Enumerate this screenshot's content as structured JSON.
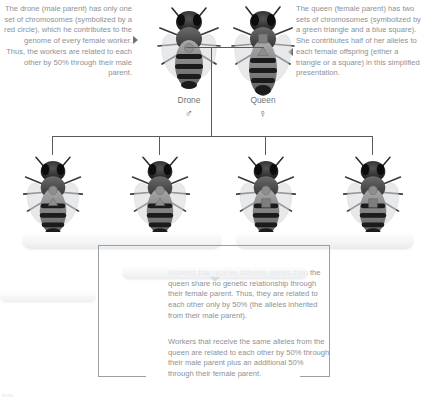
{
  "figure": {
    "caption": "tion"
  },
  "notes": {
    "drone": "The drone (male parent) has only one set of chromosomes (symbolized by a red circle), which he contributes to the genome of every female worker. Thus, the workers are related to each other by 50% through their male parent.",
    "queen": "The queen (female parent) has two sets of chromosomes (symbolized by a green triangle and a blue square). She contributes half of her alleles to each female offspring (either a triangle or a square) in this simplified presentation.",
    "different_alleles": "Workers that receive different alleles from the queen share no genetic relationship through their female parent. Thus, they are related to each other only by 50% (the alleles inherited from their male parent).",
    "same_alleles": "Workers that receive the same alleles from the queen are related to each other by 50% through their male parent plus an additional 50% through their female parent."
  },
  "parents": [
    {
      "id": "drone",
      "label": "Drone",
      "sex_symbol": "♂",
      "sex": "male",
      "alleles": [
        "circle"
      ]
    },
    {
      "id": "queen",
      "label": "Queen",
      "sex_symbol": "♀",
      "sex": "female",
      "alleles": [
        "square",
        "triangle"
      ]
    }
  ],
  "workers": [
    {
      "id": "worker-1",
      "alleles": [
        "circle",
        "triangle"
      ]
    },
    {
      "id": "worker-2",
      "alleles": [
        "circle",
        "triangle"
      ]
    },
    {
      "id": "worker-3",
      "alleles": [
        "circle",
        "square"
      ]
    },
    {
      "id": "worker-4",
      "alleles": [
        "circle",
        "square"
      ]
    }
  ],
  "symbol_colors": {
    "circle": "#8e8e8e",
    "triangle": "#8e8e8e",
    "square": "#7e7e7e",
    "circle_meaning": "red circle",
    "triangle_meaning": "green triangle",
    "square_meaning": "blue square"
  },
  "relatedness": {
    "through_male_parent": "50%",
    "additional_through_female_parent": "50%"
  },
  "colors": {
    "text": "#8d9196",
    "line": "#575b5e",
    "line_light": "#9b9fa2",
    "background": "#ffffff"
  }
}
